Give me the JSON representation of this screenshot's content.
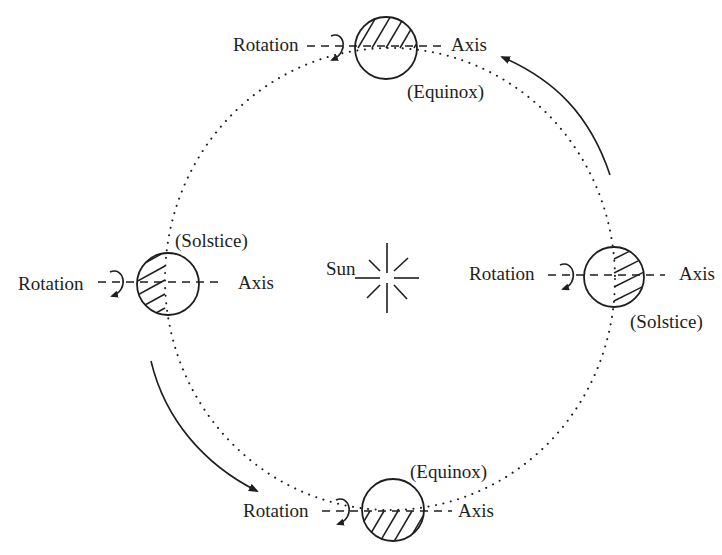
{
  "diagram": {
    "type": "earth-orbit-seasons",
    "colors": {
      "ink": "#1e1e1e",
      "background": "#ffffff"
    },
    "sun": {
      "label": "Sun"
    },
    "positions": [
      {
        "id": "top",
        "event": "(Equinox)",
        "rotation_label": "Rotation",
        "axis_label": "Axis",
        "shaded_half": "top"
      },
      {
        "id": "left",
        "event": "(Solstice)",
        "rotation_label": "Rotation",
        "axis_label": "Axis",
        "shaded_half": "left"
      },
      {
        "id": "right",
        "event": "(Solstice)",
        "rotation_label": "Rotation",
        "axis_label": "Axis",
        "shaded_half": "right"
      },
      {
        "id": "bottom",
        "event": "(Equinox)",
        "rotation_label": "Rotation",
        "axis_label": "Axis",
        "shaded_half": "bottom"
      }
    ],
    "orbit": {
      "style": "dotted",
      "direction": "counterclockwise"
    }
  }
}
